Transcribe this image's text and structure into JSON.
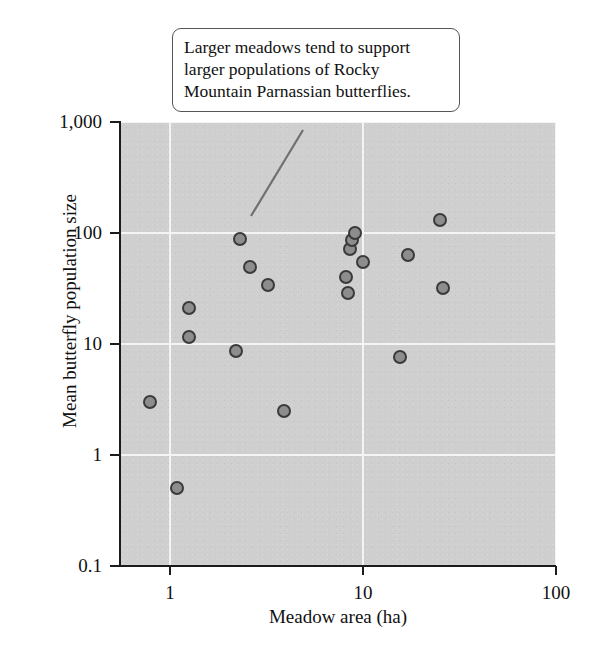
{
  "chart_data": {
    "type": "scatter",
    "title": "",
    "xlabel": "Meadow area (ha)",
    "ylabel": "Mean butterfly population size",
    "xscale": "log",
    "yscale": "log",
    "xlim": [
      0.55,
      100
    ],
    "ylim": [
      0.1,
      1000
    ],
    "xticks": [
      "1",
      "10",
      "100"
    ],
    "xtick_values": [
      1,
      10,
      100
    ],
    "yticks": [
      "1,000",
      "100",
      "10",
      "1",
      "0.1"
    ],
    "ytick_values": [
      1000,
      100,
      10,
      1,
      0.1
    ],
    "grid": true,
    "grid_color": "#f4f4f4",
    "panel_color": "#cfcfcf",
    "marker_fill": "#8d8d8d",
    "marker_edge": "#3a3a3a",
    "legend": null,
    "points": [
      {
        "x": 0.79,
        "y": 3.0
      },
      {
        "x": 1.08,
        "y": 0.5
      },
      {
        "x": 1.25,
        "y": 21
      },
      {
        "x": 1.25,
        "y": 11.5
      },
      {
        "x": 2.2,
        "y": 8.7
      },
      {
        "x": 2.3,
        "y": 88
      },
      {
        "x": 2.6,
        "y": 49
      },
      {
        "x": 3.2,
        "y": 34
      },
      {
        "x": 3.9,
        "y": 2.5
      },
      {
        "x": 8.2,
        "y": 40
      },
      {
        "x": 8.4,
        "y": 29
      },
      {
        "x": 8.6,
        "y": 72
      },
      {
        "x": 8.8,
        "y": 86
      },
      {
        "x": 9.1,
        "y": 100
      },
      {
        "x": 10.0,
        "y": 55
      },
      {
        "x": 15.5,
        "y": 7.6
      },
      {
        "x": 17.0,
        "y": 63
      },
      {
        "x": 25.0,
        "y": 130
      },
      {
        "x": 26.0,
        "y": 32
      }
    ],
    "annotations": [
      {
        "text": "Larger meadows tend to support larger populations of Rocky Mountain Parnassian butterflies.",
        "target_x": 2.3,
        "target_y": 88
      }
    ]
  }
}
